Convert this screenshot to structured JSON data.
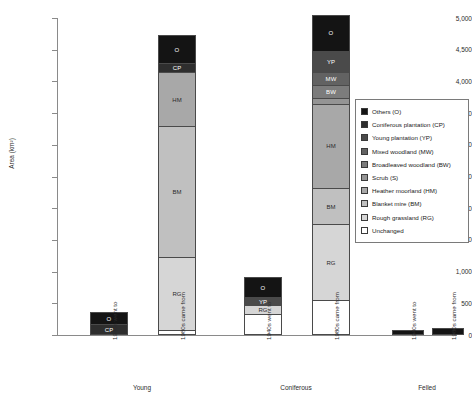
{
  "chart_data": {
    "type": "bar",
    "stacked": true,
    "title": "",
    "xlabel": "",
    "ylabel": "Area (km²)",
    "ylim": [
      0,
      5000
    ],
    "ytick_labels": [
      "5,000",
      "4,500",
      "4,000",
      "3,500",
      "3,000",
      "2,500",
      "2,000",
      "1,500",
      "1,000",
      "500",
      "0"
    ],
    "ytick_values": [
      5000,
      4500,
      4000,
      3500,
      3000,
      2500,
      2000,
      1500,
      1000,
      500,
      0
    ],
    "grid": false,
    "legend_position": "right",
    "categories": [
      "1940s went to",
      "1980s came from",
      "1940s went to",
      "1980s came from",
      "1940s went to",
      "1980s came from"
    ],
    "groups": [
      {
        "label": "Young",
        "bars": [
          0,
          1
        ]
      },
      {
        "label": "Coniferous",
        "bars": [
          2,
          3
        ]
      },
      {
        "label": "Felled",
        "bars": [
          4,
          5
        ]
      }
    ],
    "legend": [
      {
        "key": "O",
        "label": "Others (O)",
        "color": "#141414"
      },
      {
        "key": "CP",
        "label": "Coniferous plantation (CP)",
        "color": "#2e2e2e"
      },
      {
        "key": "YP",
        "label": "Young plantation (YP)",
        "color": "#4a4a4a"
      },
      {
        "key": "MW",
        "label": "Mixed woodland (MW)",
        "color": "#626262"
      },
      {
        "key": "BW",
        "label": "Broadleaved woodland (BW)",
        "color": "#7c7c7c"
      },
      {
        "key": "S",
        "label": "Scrub (S)",
        "color": "#949494"
      },
      {
        "key": "HM",
        "label": "Heather moorland (HM)",
        "color": "#a8a8a8"
      },
      {
        "key": "BM",
        "label": "Blanket mire (BM)",
        "color": "#c0c0c0"
      },
      {
        "key": "RG",
        "label": "Rough grassland (RG)",
        "color": "#d6d6d6"
      },
      {
        "key": "Unchanged",
        "label": "Unchanged",
        "color": "#ffffff"
      }
    ],
    "bars": [
      {
        "name": "young-1940s-went-to",
        "category": "1940s went to",
        "group": "Young",
        "total": 330,
        "segments": [
          {
            "key": "O",
            "label": "O",
            "value": 180
          },
          {
            "key": "CP",
            "label": "CP",
            "value": 150
          }
        ]
      },
      {
        "name": "young-1980s-came-from",
        "category": "1980s came from",
        "group": "Young",
        "total": 4700,
        "segments": [
          {
            "key": "O",
            "label": "O",
            "value": 430
          },
          {
            "key": "CP",
            "label": "CP",
            "value": 140
          },
          {
            "key": "HM",
            "label": "HM",
            "value": 850
          },
          {
            "key": "BM",
            "label": "BM",
            "value": 2070
          },
          {
            "key": "RG",
            "label": "RG",
            "value": 1140
          },
          {
            "key": "Unchanged",
            "label": "",
            "value": 70
          }
        ]
      },
      {
        "name": "coniferous-1940s-went-to",
        "category": "1940s went to",
        "group": "Coniferous",
        "total": 880,
        "segments": [
          {
            "key": "O",
            "label": "O",
            "value": 300
          },
          {
            "key": "YP",
            "label": "YP",
            "value": 130
          },
          {
            "key": "RG",
            "label": "RG",
            "value": 140
          },
          {
            "key": "Unchanged",
            "label": "",
            "value": 310
          }
        ]
      },
      {
        "name": "coniferous-1980s-came-from",
        "category": "1980s came from",
        "group": "Coniferous",
        "total": 5020,
        "segments": [
          {
            "key": "O",
            "label": "O",
            "value": 560
          },
          {
            "key": "YP",
            "label": "YP",
            "value": 330
          },
          {
            "key": "MW",
            "label": "MW",
            "value": 200
          },
          {
            "key": "BW",
            "label": "BW",
            "value": 200
          },
          {
            "key": "S",
            "label": "",
            "value": 100
          },
          {
            "key": "HM",
            "label": "HM",
            "value": 1330
          },
          {
            "key": "BM",
            "label": "BM",
            "value": 570
          },
          {
            "key": "RG",
            "label": "RG",
            "value": 1200
          },
          {
            "key": "Unchanged",
            "label": "",
            "value": 530
          }
        ]
      },
      {
        "name": "felled-1940s-went-to",
        "category": "1940s went to",
        "group": "Felled",
        "total": 50,
        "segments": [
          {
            "key": "O",
            "label": "",
            "value": 50
          }
        ]
      },
      {
        "name": "felled-1980s-came-from",
        "category": "1980s came from",
        "group": "Felled",
        "total": 80,
        "segments": [
          {
            "key": "O",
            "label": "O",
            "value": 80
          }
        ]
      }
    ]
  }
}
